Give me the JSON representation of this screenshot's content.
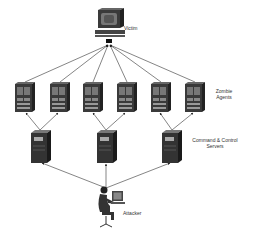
{
  "diagram": {
    "nodes": {
      "victim": {
        "label": "Victim"
      },
      "zombies": {
        "label_line1": "Zombie",
        "label_line2": "Agents",
        "count": 6
      },
      "cnc": {
        "label_line1": "Command & Control",
        "label_line2": "Servers",
        "count": 3
      },
      "attacker": {
        "label": "Attacker"
      }
    },
    "edges": [
      "Attacker -> C&C Server 1",
      "Attacker -> C&C Server 2",
      "Attacker -> C&C Server 3",
      "C&C Server 1 -> Zombie 1",
      "C&C Server 1 -> Zombie 2",
      "C&C Server 2 -> Zombie 3",
      "C&C Server 2 -> Zombie 4",
      "C&C Server 3 -> Zombie 5",
      "C&C Server 3 -> Zombie 6",
      "Zombie 1-6 -> Victim"
    ]
  }
}
